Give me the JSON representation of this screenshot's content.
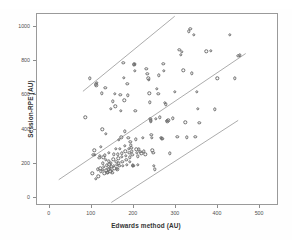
{
  "figure": {
    "background": "#ffffff",
    "frame_color": "#9a9a9a",
    "marker_color": "#6e6e6e",
    "line_color": "#8f8f8f"
  },
  "chart_data": {
    "type": "scatter",
    "title": "",
    "subtitle": "",
    "xlabel": "Edwards method (AU)",
    "ylabel": "Session-RPE (AU)",
    "xlim": [
      -30,
      545
    ],
    "ylim": [
      -45,
      1075
    ],
    "xticks": [
      0,
      100,
      200,
      300,
      400,
      500
    ],
    "xticklabels": [
      "0",
      "100",
      "200",
      "300",
      "400",
      "500"
    ],
    "yticks": [
      0,
      200,
      400,
      600,
      800,
      1000
    ],
    "yticklabels": [
      "0",
      "200",
      "400",
      "600",
      "800",
      "1000"
    ],
    "grid": false,
    "legend": null,
    "marker_style": "open-circle",
    "annotations": [],
    "series": [
      {
        "name": "Session-RPE vs Edwards method",
        "points": [
          [
            85,
            472
          ],
          [
            96,
            700
          ],
          [
            101,
            146
          ],
          [
            104,
            253
          ],
          [
            106,
            280
          ],
          [
            107,
            254
          ],
          [
            109,
            113
          ],
          [
            110,
            664
          ],
          [
            111,
            660
          ],
          [
            112,
            672
          ],
          [
            114,
            168
          ],
          [
            116,
            128
          ],
          [
            118,
            235
          ],
          [
            119,
            247
          ],
          [
            120,
            174
          ],
          [
            121,
            158
          ],
          [
            122,
            300
          ],
          [
            124,
            612
          ],
          [
            125,
            403
          ],
          [
            126,
            166
          ],
          [
            127,
            204
          ],
          [
            128,
            240
          ],
          [
            129,
            182
          ],
          [
            130,
            145
          ],
          [
            131,
            250
          ],
          [
            132,
            646
          ],
          [
            133,
            376
          ],
          [
            134,
            226
          ],
          [
            135,
            163
          ],
          [
            136,
            192
          ],
          [
            137,
            149
          ],
          [
            138,
            152
          ],
          [
            139,
            170
          ],
          [
            140,
            265
          ],
          [
            141,
            216
          ],
          [
            142,
            198
          ],
          [
            143,
            174
          ],
          [
            144,
            158
          ],
          [
            145,
            523
          ],
          [
            146,
            205
          ],
          [
            147,
            183
          ],
          [
            148,
            162
          ],
          [
            149,
            147
          ],
          [
            150,
            566
          ],
          [
            151,
            228
          ],
          [
            152,
            256
          ],
          [
            153,
            189
          ],
          [
            154,
            176
          ],
          [
            155,
            610
          ],
          [
            156,
            537
          ],
          [
            157,
            288
          ],
          [
            158,
            214
          ],
          [
            159,
            196
          ],
          [
            160,
            171
          ],
          [
            161,
            168
          ],
          [
            162,
            256
          ],
          [
            163,
            233
          ],
          [
            164,
            340
          ],
          [
            165,
            203
          ],
          [
            166,
            188
          ],
          [
            167,
            289
          ],
          [
            168,
            604
          ],
          [
            169,
            510
          ],
          [
            170,
            355
          ],
          [
            171,
            263
          ],
          [
            172,
            243
          ],
          [
            173,
            214
          ],
          [
            174,
            190
          ],
          [
            175,
            790
          ],
          [
            176,
            704
          ],
          [
            177,
            572
          ],
          [
            178,
            390
          ],
          [
            179,
            305
          ],
          [
            180,
            275
          ],
          [
            181,
            248
          ],
          [
            182,
            226
          ],
          [
            183,
            196
          ],
          [
            185,
            668
          ],
          [
            186,
            601
          ],
          [
            187,
            352
          ],
          [
            188,
            287
          ],
          [
            189,
            265
          ],
          [
            190,
            239
          ],
          [
            191,
            214
          ],
          [
            192,
            330
          ],
          [
            193,
            310
          ],
          [
            194,
            293
          ],
          [
            195,
            275
          ],
          [
            196,
            254
          ],
          [
            197,
            193
          ],
          [
            198,
            190
          ],
          [
            199,
            188
          ],
          [
            200,
            782
          ],
          [
            201,
            777
          ],
          [
            202,
            784
          ],
          [
            203,
            742
          ],
          [
            204,
            512
          ],
          [
            205,
            345
          ],
          [
            206,
            286
          ],
          [
            207,
            266
          ],
          [
            209,
            244
          ],
          [
            210,
            196
          ],
          [
            212,
            286
          ],
          [
            215,
            272
          ],
          [
            218,
            263
          ],
          [
            221,
            354
          ],
          [
            224,
            274
          ],
          [
            227,
            256
          ],
          [
            230,
            757
          ],
          [
            232,
            727
          ],
          [
            234,
            700
          ],
          [
            236,
            690
          ],
          [
            237,
            612
          ],
          [
            238,
            560
          ],
          [
            239,
            464
          ],
          [
            240,
            455
          ],
          [
            241,
            448
          ],
          [
            242,
            370
          ],
          [
            243,
            352
          ],
          [
            244,
            279
          ],
          [
            246,
            266
          ],
          [
            248,
            191
          ],
          [
            250,
            170
          ],
          [
            252,
            462
          ],
          [
            255,
            640
          ],
          [
            258,
            608
          ],
          [
            260,
            717
          ],
          [
            262,
            472
          ],
          [
            264,
            352
          ],
          [
            266,
            350
          ],
          [
            268,
            348
          ],
          [
            270,
            786
          ],
          [
            272,
            744
          ],
          [
            274,
            556
          ],
          [
            276,
            548
          ],
          [
            278,
            453
          ],
          [
            280,
            450
          ],
          [
            282,
            455
          ],
          [
            285,
            263
          ],
          [
            292,
            466
          ],
          [
            298,
            622
          ],
          [
            303,
            358
          ],
          [
            308,
            866
          ],
          [
            311,
            838
          ],
          [
            314,
            856
          ],
          [
            318,
            746
          ],
          [
            322,
            444
          ],
          [
            326,
            356
          ],
          [
            330,
            975
          ],
          [
            334,
            990
          ],
          [
            338,
            728
          ],
          [
            342,
            953
          ],
          [
            346,
            358
          ],
          [
            350,
            620
          ],
          [
            352,
            521
          ],
          [
            356,
            440
          ],
          [
            372,
            858
          ],
          [
            383,
            860
          ],
          [
            392,
            520
          ],
          [
            398,
            700
          ],
          [
            428,
            953
          ],
          [
            440,
            700
          ],
          [
            448,
            830
          ],
          [
            452,
            833
          ]
        ]
      }
    ],
    "reference_lines": [
      {
        "name": "upper-limit-of-agreement",
        "style": "solid",
        "x": [
          80,
          300
        ],
        "y": [
          619,
          1062
        ]
      },
      {
        "name": "mean-bias",
        "style": "solid",
        "x": [
          22,
          470
        ],
        "y": [
          98,
          842
        ]
      },
      {
        "name": "lower-limit-of-agreement",
        "style": "solid",
        "x": [
          148,
          452
        ],
        "y": [
          -36,
          448
        ]
      }
    ]
  }
}
